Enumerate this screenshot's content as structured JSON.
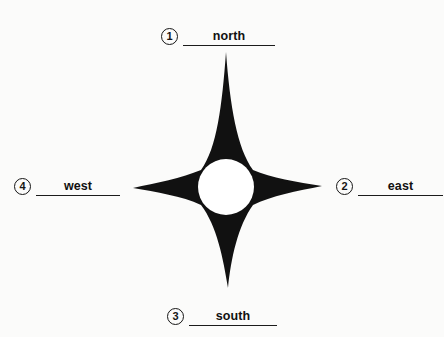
{
  "diagram": {
    "kind": "compass-rose",
    "background_color": "#fbfbfa",
    "ink_color": "#111111",
    "star": {
      "name": "four-pointed-compass-star",
      "fill_color": "#111111",
      "center_circle_color": "#ffffff",
      "points": [
        "north",
        "east",
        "south",
        "west"
      ],
      "center": {
        "x": 226,
        "y": 187
      },
      "center_circle_radius": 27,
      "tips": {
        "north": {
          "x": 226,
          "y": 52
        },
        "east": {
          "x": 322,
          "y": 186
        },
        "south": {
          "x": 228,
          "y": 288
        },
        "west": {
          "x": 133,
          "y": 188
        }
      }
    },
    "labels": [
      {
        "number": "1",
        "circled": "①",
        "text": "north",
        "position": "top"
      },
      {
        "number": "2",
        "circled": "②",
        "text": "east",
        "position": "right"
      },
      {
        "number": "3",
        "circled": "③",
        "text": "south",
        "position": "bottom"
      },
      {
        "number": "4",
        "circled": "④",
        "text": "west",
        "position": "left"
      }
    ]
  }
}
